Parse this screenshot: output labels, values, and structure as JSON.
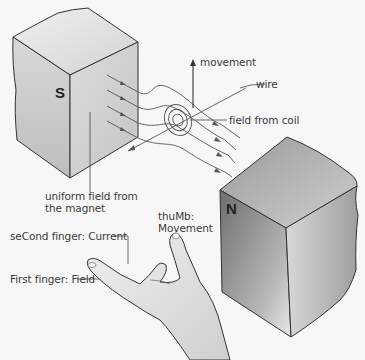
{
  "diagram": {
    "colors": {
      "background": "#f7f7f7",
      "magnet_light": "#e6e6e6",
      "magnet_mid": "#c9c9c9",
      "magnet_dark": "#7a7a7a",
      "line": "#444444",
      "hand_fill": "#dcdcdc"
    },
    "magnets": {
      "south": {
        "pole_label": "S"
      },
      "north": {
        "pole_label": "N"
      }
    },
    "labels": {
      "movement": "movement",
      "wire": "wire",
      "field_from_coil": "field from coil",
      "uniform_field_line1": "uniform field from",
      "uniform_field_line2": "the magnet",
      "thumb_line1": "thuMb:",
      "thumb_line2": "Movement",
      "second_finger": "seCond finger: Current",
      "first_finger": "First finger: Field"
    }
  }
}
